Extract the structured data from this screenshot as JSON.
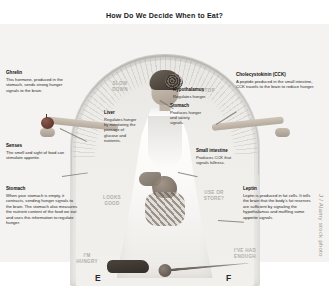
{
  "title": "How Do We Decide When to Eat?",
  "gauge": {
    "empty_label": "E",
    "full_label": "F",
    "zones": {
      "slow_down": "SLOW DOWN",
      "stop": "STOP",
      "looks_good": "LOOKS GOOD",
      "use_or_store": "USE OR STORE?",
      "im_hungry": "I'M HUNGRY",
      "ive_had_enough": "I'VE HAD ENOUGH"
    }
  },
  "callouts": {
    "ghrelin": {
      "title": "Ghrelin",
      "body": "This hormone, produced in the stomach, sends strong hunger signals to the brain."
    },
    "senses": {
      "title": "Senses",
      "body": "The smell and sight of food can stimulate appetite."
    },
    "stomach_outer": {
      "title": "Stomach",
      "body": "When your stomach is empty, it contracts, sending hunger signals to the brain. The stomach also measures the nutrient content of the food we eat and uses this information to regulate hunger."
    },
    "cck": {
      "title": "Cholecystokinin (CCK)",
      "body": "A peptide produced in the small intestine, CCK travels to the brain to reduce hunger."
    },
    "leptin": {
      "title": "Leptin",
      "body": "Leptin is produced in fat cells. It tells the brain that the body's fat reserves are sufficient by signaling the hypothalamus and muffling some appetite signals."
    },
    "hypothalamus": {
      "title": "Hypothalamus",
      "body": "Regulates hunger."
    },
    "stomach_inner": {
      "title": "Stomach",
      "body": "Produces hunger and satiety signals."
    },
    "liver": {
      "title": "Liver",
      "body": "Regulates hunger by monitoring the passage of glucose and nutrients."
    },
    "small_intestine": {
      "title": "Small intestine",
      "body": "Produces CCK that signals fullness."
    }
  },
  "watermark": "J / Alamy stock photo"
}
